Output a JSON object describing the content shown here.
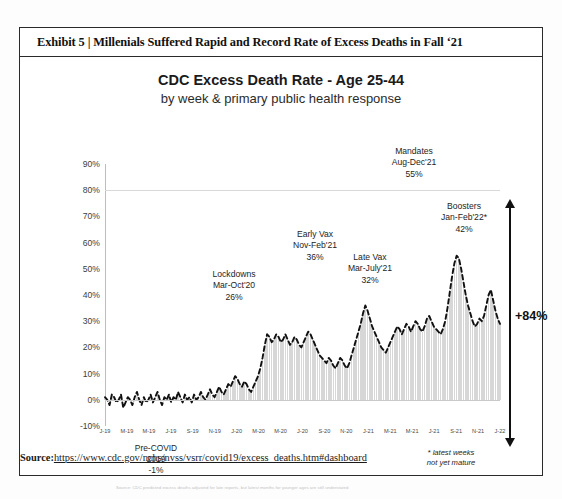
{
  "exhibit": {
    "title": "Exhibit 5 | Millenials Suffered Rapid and Record Rate of Excess Deaths in Fall ‘21"
  },
  "source": {
    "label": "Source:",
    "url": "https://www.cdc.gov/nchs/nvss/vsrr/covid19/excess_deaths.htm#dashboard"
  },
  "footnote": {
    "chart_source_note": "Source: CDC predicted excess deaths adjusted for late reports, but latest months for younger ages are still understated",
    "maturity_note_line1": "* latest weeks",
    "maturity_note_line2": "not yet mature"
  },
  "total_change": {
    "label": "+84%"
  },
  "chart_data": {
    "type": "line",
    "title": "CDC Excess Death Rate - Age 25-44",
    "subtitle": "by week & primary public health response",
    "xlabel": "",
    "ylabel": "",
    "ylim": [
      -10,
      90
    ],
    "ytick_labels": [
      "90%",
      "80%",
      "70%",
      "60%",
      "50%",
      "40%",
      "30%",
      "20%",
      "10%",
      "0%",
      "-10%"
    ],
    "ytick_values": [
      90,
      80,
      70,
      60,
      50,
      40,
      30,
      20,
      10,
      0,
      -10
    ],
    "grid": true,
    "gridlines_at": [
      80,
      0
    ],
    "legend_position": "none",
    "xtick_labels": [
      "J-19",
      "M-19",
      "M-19",
      "J-19",
      "S-19",
      "N-19",
      "J-20",
      "M-20",
      "M-20",
      "J-20",
      "S-20",
      "N-20",
      "J-21",
      "M-21",
      "M-21",
      "J-21",
      "S-21",
      "N-21",
      "J-22"
    ],
    "series": [
      {
        "name": "Excess death rate, age 25-44 (weekly)",
        "style": "dashed-line-with-bars",
        "values": [
          1,
          0,
          -2,
          2,
          1,
          -1,
          0,
          2,
          -3,
          -1,
          1,
          0,
          -2,
          1,
          3,
          0,
          -2,
          1,
          -1,
          0,
          2,
          -1,
          1,
          3,
          0,
          -2,
          1,
          0,
          2,
          -1,
          1,
          0,
          3,
          1,
          -1,
          2,
          0,
          1,
          -1,
          2,
          0,
          1,
          3,
          1,
          0,
          2,
          4,
          2,
          1,
          3,
          5,
          3,
          2,
          4,
          6,
          5,
          7,
          9,
          8,
          6,
          5,
          7,
          6,
          4,
          3,
          5,
          7,
          9,
          12,
          16,
          21,
          25,
          24,
          22,
          23,
          25,
          24,
          22,
          23,
          25,
          23,
          21,
          22,
          24,
          23,
          21,
          20,
          22,
          24,
          26,
          25,
          23,
          21,
          19,
          17,
          16,
          15,
          14,
          16,
          15,
          13,
          12,
          14,
          16,
          15,
          13,
          12,
          14,
          17,
          20,
          23,
          26,
          29,
          33,
          36,
          34,
          31,
          28,
          26,
          24,
          22,
          20,
          19,
          18,
          20,
          22,
          24,
          26,
          28,
          27,
          25,
          27,
          29,
          28,
          26,
          28,
          30,
          29,
          27,
          26,
          28,
          31,
          32,
          30,
          28,
          27,
          26,
          25,
          27,
          30,
          35,
          41,
          47,
          52,
          55,
          54,
          50,
          45,
          40,
          36,
          33,
          30,
          28,
          29,
          31,
          30,
          32,
          36,
          40,
          42,
          38,
          34,
          31,
          29
        ]
      }
    ],
    "annotations": [
      {
        "name": "pre-covid",
        "line1": "Pre-COVID",
        "line2": "2019",
        "line3": "-1%"
      },
      {
        "name": "lockdowns",
        "line1": "Lockdowns",
        "line2": "Mar-Oct'20",
        "line3": "26%"
      },
      {
        "name": "early-vax",
        "line1": "Early Vax",
        "line2": "Nov-Feb'21",
        "line3": "36%"
      },
      {
        "name": "late-vax",
        "line1": "Late Vax",
        "line2": "Mar-July'21",
        "line3": "32%"
      },
      {
        "name": "mandates",
        "line1": "Mandates",
        "line2": "Aug-Dec'21",
        "line3": "55%"
      },
      {
        "name": "boosters",
        "line1": "Boosters",
        "line2": "Jan-Feb'22*",
        "line3": "42%"
      }
    ]
  }
}
